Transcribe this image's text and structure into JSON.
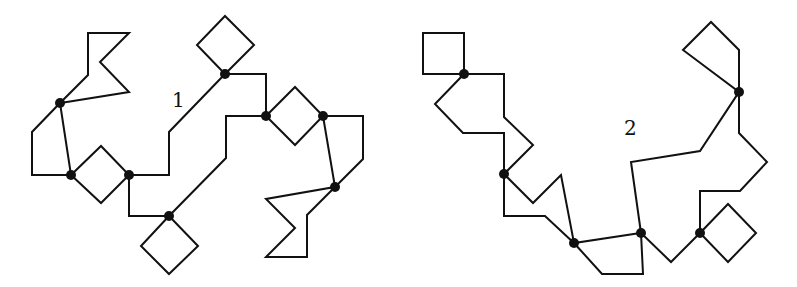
{
  "figures": [
    {
      "id": "1",
      "label": "1",
      "label_pos": [
        172,
        88
      ],
      "paths": [
        [
          [
            60,
            103
          ],
          [
            88,
            75
          ],
          [
            88,
            33
          ],
          [
            129,
            33
          ],
          [
            100,
            62
          ],
          [
            129,
            92
          ],
          [
            60,
            103
          ]
        ],
        [
          [
            60,
            103
          ],
          [
            32,
            132
          ],
          [
            32,
            175
          ],
          [
            71,
            175
          ]
        ],
        [
          [
            60,
            103
          ],
          [
            71,
            175
          ]
        ],
        [
          [
            71,
            175
          ],
          [
            101,
            146
          ],
          [
            129,
            175
          ],
          [
            101,
            203
          ],
          [
            71,
            175
          ]
        ],
        [
          [
            129,
            175
          ],
          [
            169,
            175
          ],
          [
            169,
            132
          ],
          [
            225,
            74
          ]
        ],
        [
          [
            225,
            74
          ],
          [
            197,
            45
          ],
          [
            225,
            16
          ],
          [
            254,
            45
          ],
          [
            225,
            74
          ]
        ],
        [
          [
            225,
            74
          ],
          [
            266,
            74
          ],
          [
            266,
            116
          ]
        ],
        [
          [
            129,
            175
          ],
          [
            129,
            216
          ],
          [
            169,
            216
          ]
        ],
        [
          [
            169,
            216
          ],
          [
            141,
            246
          ],
          [
            169,
            274
          ],
          [
            198,
            246
          ],
          [
            169,
            216
          ]
        ],
        [
          [
            169,
            216
          ],
          [
            226,
            158
          ],
          [
            226,
            116
          ],
          [
            266,
            116
          ]
        ],
        [
          [
            266,
            116
          ],
          [
            295,
            87
          ],
          [
            323,
            116
          ],
          [
            295,
            145
          ],
          [
            266,
            116
          ]
        ],
        [
          [
            323,
            116
          ],
          [
            363,
            116
          ],
          [
            363,
            159
          ],
          [
            335,
            187
          ]
        ],
        [
          [
            323,
            116
          ],
          [
            335,
            187
          ]
        ],
        [
          [
            335,
            187
          ],
          [
            266,
            199
          ],
          [
            295,
            228
          ],
          [
            266,
            257
          ],
          [
            307,
            257
          ],
          [
            307,
            215
          ],
          [
            335,
            187
          ]
        ]
      ],
      "nodes": [
        [
          60,
          103
        ],
        [
          71,
          175
        ],
        [
          129,
          175
        ],
        [
          169,
          216
        ],
        [
          225,
          74
        ],
        [
          266,
          116
        ],
        [
          323,
          116
        ],
        [
          335,
          187
        ]
      ]
    },
    {
      "id": "2",
      "label": "2",
      "label_pos": [
        624,
        116
      ],
      "paths": [
        [
          [
            423,
            33
          ],
          [
            464,
            33
          ],
          [
            464,
            74
          ],
          [
            423,
            74
          ],
          [
            423,
            33
          ]
        ],
        [
          [
            464,
            74
          ],
          [
            504,
            74
          ],
          [
            504,
            117
          ],
          [
            533,
            145
          ],
          [
            504,
            174
          ]
        ],
        [
          [
            464,
            74
          ],
          [
            435,
            104
          ],
          [
            463,
            133
          ],
          [
            504,
            133
          ],
          [
            504,
            174
          ]
        ],
        [
          [
            504,
            174
          ],
          [
            533,
            203
          ],
          [
            561,
            175
          ],
          [
            574,
            243
          ]
        ],
        [
          [
            504,
            174
          ],
          [
            504,
            216
          ],
          [
            545,
            216
          ],
          [
            574,
            243
          ]
        ],
        [
          [
            574,
            243
          ],
          [
            641,
            233
          ]
        ],
        [
          [
            574,
            243
          ],
          [
            602,
            274
          ],
          [
            643,
            274
          ],
          [
            641,
            233
          ]
        ],
        [
          [
            641,
            233
          ],
          [
            631,
            162
          ],
          [
            700,
            151
          ],
          [
            739,
            92
          ]
        ],
        [
          [
            739,
            92
          ],
          [
            683,
            50
          ],
          [
            711,
            22
          ],
          [
            739,
            50
          ],
          [
            739,
            92
          ]
        ],
        [
          [
            739,
            92
          ],
          [
            739,
            133
          ],
          [
            767,
            162
          ],
          [
            740,
            191
          ],
          [
            700,
            191
          ],
          [
            700,
            233
          ]
        ],
        [
          [
            641,
            233
          ],
          [
            671,
            262
          ],
          [
            700,
            233
          ]
        ],
        [
          [
            700,
            233
          ],
          [
            728,
            204
          ],
          [
            756,
            233
          ],
          [
            728,
            262
          ],
          [
            700,
            233
          ]
        ]
      ],
      "nodes": [
        [
          464,
          74
        ],
        [
          504,
          174
        ],
        [
          574,
          243
        ],
        [
          641,
          233
        ],
        [
          739,
          92
        ],
        [
          700,
          233
        ]
      ]
    }
  ],
  "style": {
    "stroke": "#111111",
    "node_fill": "#111111",
    "node_radius": 5
  }
}
